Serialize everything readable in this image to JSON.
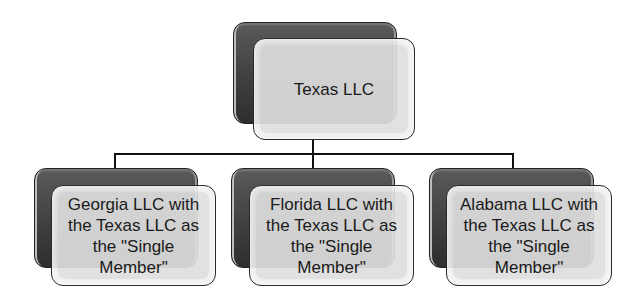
{
  "diagram": {
    "type": "org-chart",
    "root": {
      "label": "Texas LLC"
    },
    "children": [
      {
        "label": "Georgia LLC with the Texas LLC as the \"Single Member\""
      },
      {
        "label": "Florida LLC with the Texas LLC as the \"Single Member\""
      },
      {
        "label": "Alabama LLC with the Texas LLC as the \"Single Member\""
      }
    ],
    "colors": {
      "back_box": "#3e3e3e",
      "front_box": "#ececec",
      "connector": "#111111",
      "text": "#1a1a1a"
    }
  }
}
